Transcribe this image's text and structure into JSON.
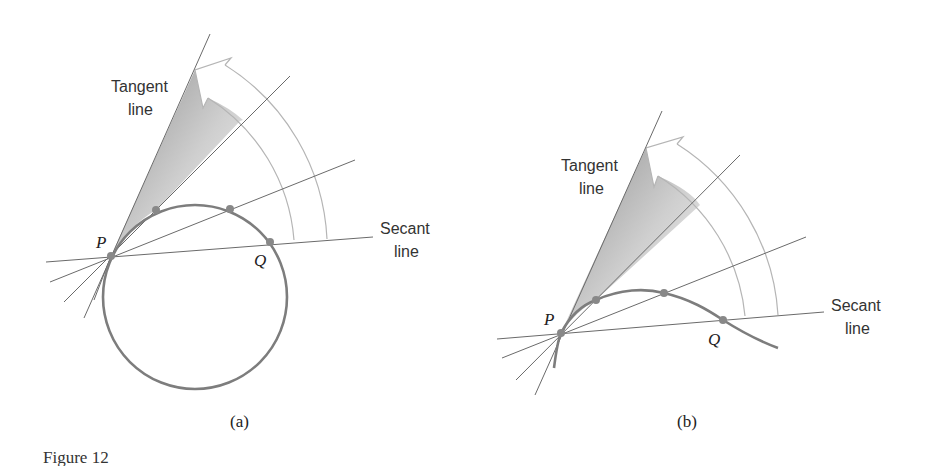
{
  "figure": {
    "caption": "Figure 12",
    "colors": {
      "lines": "#6a6a6a",
      "curve": "#7d7d7d",
      "arrow_outline": "#b5b5b5",
      "shade": "#9a9a9a",
      "background": "#ffffff"
    }
  },
  "panels": [
    {
      "id": "a",
      "sublabel": "(a)",
      "curve_type": "circle",
      "labels": {
        "tangent_line": [
          "Tangent",
          "line"
        ],
        "secant_line": [
          "Secant",
          "line"
        ],
        "point_p": "P",
        "point_q": "Q"
      }
    },
    {
      "id": "b",
      "sublabel": "(b)",
      "curve_type": "smooth curve",
      "labels": {
        "tangent_line": [
          "Tangent",
          "line"
        ],
        "secant_line": [
          "Secant",
          "line"
        ],
        "point_p": "P",
        "point_q": "Q"
      }
    }
  ]
}
